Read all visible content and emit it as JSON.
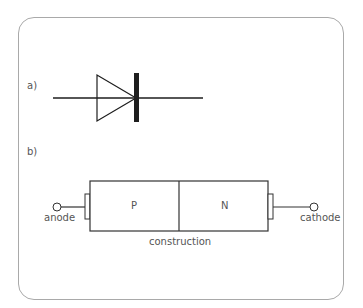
{
  "panel_a": {
    "label": "a)",
    "symbol": "diode"
  },
  "panel_b": {
    "label": "b)",
    "regions": [
      {
        "label": "P"
      },
      {
        "label": "N"
      }
    ],
    "terminals": {
      "left": "anode",
      "right": "cathode"
    },
    "caption": "construction"
  },
  "colors": {
    "frame": "#a9a9a9",
    "line": "#222222",
    "text": "#555555"
  }
}
